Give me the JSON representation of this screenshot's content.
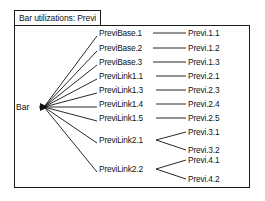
{
  "window": {
    "title": "Bar utilizations: Previ"
  },
  "graph": {
    "root": {
      "label": "Bar"
    },
    "mid_nodes": [
      {
        "label": "PreviBase.1"
      },
      {
        "label": "PreviBase.2"
      },
      {
        "label": "PreviBase.3"
      },
      {
        "label": "PreviLink1.1"
      },
      {
        "label": "PreviLink1.3"
      },
      {
        "label": "PreviLink1.4"
      },
      {
        "label": "PreviLink1.5"
      },
      {
        "label": "PreviLink2.1"
      },
      {
        "label": "PreviLink2.2"
      }
    ],
    "leaf_nodes": [
      {
        "label": "Previ.1.1"
      },
      {
        "label": "Previ.1.2"
      },
      {
        "label": "Previ.1.3"
      },
      {
        "label": "Previ.2.1"
      },
      {
        "label": "Previ.2.3"
      },
      {
        "label": "Previ.2.4"
      },
      {
        "label": "Previ.2.5"
      },
      {
        "label": "Previ.3.1"
      },
      {
        "label": "Previ.3.2"
      },
      {
        "label": "Previ.4.1"
      },
      {
        "label": "Previ.4.2"
      }
    ],
    "colors": {
      "stroke": "#111111",
      "background": "#ffffff",
      "border": "#1a1a1a"
    }
  }
}
